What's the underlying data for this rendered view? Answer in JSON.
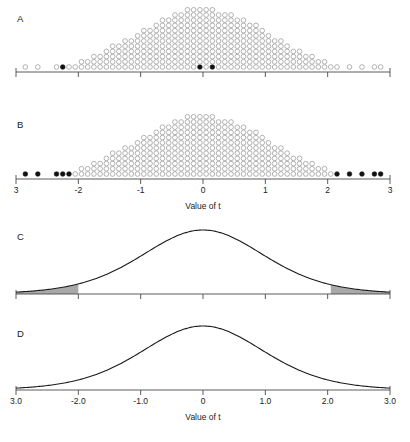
{
  "figure": {
    "background_color": "#ffffff",
    "width": 410,
    "height": 442
  },
  "panels": [
    {
      "id": "A",
      "letter": "A",
      "type": "dotplot",
      "axis": {
        "label": "",
        "ticks": [
          "-3",
          "-2",
          "-1",
          "0",
          "1",
          "2",
          "3"
        ],
        "tick_values": [
          -3,
          -2,
          -1,
          0,
          1,
          2,
          3
        ],
        "show_labels": false,
        "xlim": [
          -3,
          3
        ]
      },
      "highlight_note": "filled dots mark selected observed t values",
      "filled_values": [
        -2.2,
        -0.1,
        0.12
      ]
    },
    {
      "id": "B",
      "letter": "B",
      "type": "dotplot",
      "axis": {
        "label": "Value of t",
        "ticks": [
          "3",
          "-2",
          "-1",
          "0",
          "1",
          "2",
          "3"
        ],
        "tick_values": [
          -3,
          -2,
          -1,
          0,
          1,
          2,
          3
        ],
        "show_labels": true,
        "xlim": [
          -3,
          3
        ]
      },
      "highlight_note": "filled dots mark the extreme 5% in both tails",
      "filled_values": [
        -2.78,
        -2.56,
        -2.24,
        -2.15,
        -2.06,
        2.1,
        2.32,
        2.55,
        2.76,
        2.86
      ]
    },
    {
      "id": "C",
      "letter": "C",
      "type": "density",
      "axis": {
        "label": "",
        "ticks": [
          "-3",
          "-2",
          "-1",
          "0",
          "1",
          "2",
          "3"
        ],
        "tick_values": [
          -3,
          -2,
          -1,
          0,
          1,
          2,
          3
        ],
        "show_labels": false,
        "xlim": [
          -3,
          3
        ]
      },
      "shaded_tails": true,
      "shade_color": "#a9a9a9",
      "shade_left_to": -2.0,
      "shade_right_from": 2.05
    },
    {
      "id": "D",
      "letter": "D",
      "type": "density",
      "axis": {
        "label": "Value of t",
        "ticks": [
          "3.0",
          "-2.0",
          "-1.0",
          "0",
          "1.0",
          "2.0",
          "3.0"
        ],
        "tick_values": [
          -3,
          -2,
          -1,
          0,
          1,
          2,
          3
        ],
        "show_labels": true,
        "xlim": [
          -3,
          3
        ]
      },
      "shaded_tails": false
    }
  ],
  "chart_data": {
    "type": "scatter",
    "xlabel": "Value of t",
    "ylabel": "",
    "xlim": [
      -3,
      3
    ],
    "grid": false,
    "legend": "none",
    "panels": [
      {
        "name": "A",
        "type": "dotplot",
        "description": "Stacked dot plot of simulated t values, three dots filled black",
        "bin_width": 0.1,
        "bin_centers": [
          -2.85,
          -2.65,
          -2.35,
          -2.25,
          -2.15,
          -2.05,
          -1.95,
          -1.85,
          -1.75,
          -1.65,
          -1.55,
          -1.45,
          -1.35,
          -1.25,
          -1.15,
          -1.05,
          -0.95,
          -0.85,
          -0.75,
          -0.65,
          -0.55,
          -0.45,
          -0.35,
          -0.25,
          -0.15,
          -0.05,
          0.05,
          0.15,
          0.25,
          0.35,
          0.45,
          0.55,
          0.65,
          0.75,
          0.85,
          0.95,
          1.05,
          1.15,
          1.25,
          1.35,
          1.45,
          1.55,
          1.65,
          1.75,
          1.85,
          1.95,
          2.05,
          2.15,
          2.35,
          2.55,
          2.75,
          2.85
        ],
        "counts": [
          1,
          1,
          1,
          1,
          1,
          1,
          2,
          2,
          3,
          3,
          4,
          5,
          5,
          6,
          6,
          7,
          8,
          8,
          9,
          10,
          10,
          11,
          11,
          12,
          12,
          12,
          12,
          12,
          11,
          11,
          11,
          10,
          10,
          9,
          9,
          8,
          7,
          6,
          6,
          5,
          4,
          4,
          3,
          3,
          2,
          2,
          1,
          1,
          1,
          1,
          1,
          1
        ],
        "filled_values": [
          -2.25,
          -0.05,
          0.15
        ]
      },
      {
        "name": "B",
        "type": "dotplot",
        "description": "Same stacked dot plot with the extreme 5% of dots filled black",
        "bin_width": 0.1,
        "bin_centers": [
          -2.85,
          -2.65,
          -2.35,
          -2.25,
          -2.15,
          -2.05,
          -1.95,
          -1.85,
          -1.75,
          -1.65,
          -1.55,
          -1.45,
          -1.35,
          -1.25,
          -1.15,
          -1.05,
          -0.95,
          -0.85,
          -0.75,
          -0.65,
          -0.55,
          -0.45,
          -0.35,
          -0.25,
          -0.15,
          -0.05,
          0.05,
          0.15,
          0.25,
          0.35,
          0.45,
          0.55,
          0.65,
          0.75,
          0.85,
          0.95,
          1.05,
          1.15,
          1.25,
          1.35,
          1.45,
          1.55,
          1.65,
          1.75,
          1.85,
          1.95,
          2.05,
          2.15,
          2.35,
          2.55,
          2.75,
          2.85
        ],
        "counts": [
          1,
          1,
          1,
          1,
          1,
          1,
          2,
          2,
          3,
          3,
          4,
          5,
          5,
          6,
          6,
          7,
          8,
          8,
          9,
          10,
          10,
          11,
          11,
          12,
          12,
          12,
          12,
          12,
          11,
          11,
          11,
          10,
          10,
          9,
          9,
          8,
          7,
          6,
          6,
          5,
          4,
          4,
          3,
          3,
          2,
          2,
          1,
          1,
          1,
          1,
          1,
          1
        ],
        "filled_values": [
          -2.85,
          -2.65,
          -2.35,
          -2.25,
          -2.15,
          2.15,
          2.35,
          2.55,
          2.75,
          2.85
        ]
      },
      {
        "name": "C",
        "type": "line",
        "description": "t density curve with both tails beyond |t| = 2 shaded grey",
        "df": 10,
        "x": [
          -3,
          -2.5,
          -2,
          -1.5,
          -1,
          -0.5,
          0,
          0.5,
          1,
          1.5,
          2,
          2.5,
          3
        ],
        "y": [
          0.011,
          0.026,
          0.061,
          0.127,
          0.236,
          0.356,
          0.389,
          0.356,
          0.236,
          0.127,
          0.061,
          0.026,
          0.011
        ],
        "shaded_regions": [
          [
            -3,
            -2.0
          ],
          [
            2.05,
            3
          ]
        ]
      },
      {
        "name": "D",
        "type": "line",
        "description": "t density curve with no shading",
        "df": 10,
        "x": [
          -3,
          -2.5,
          -2,
          -1.5,
          -1,
          -0.5,
          0,
          0.5,
          1,
          1.5,
          2,
          2.5,
          3
        ],
        "y": [
          0.011,
          0.026,
          0.061,
          0.127,
          0.236,
          0.356,
          0.389,
          0.356,
          0.236,
          0.127,
          0.061,
          0.026,
          0.011
        ],
        "shaded_regions": []
      }
    ]
  }
}
